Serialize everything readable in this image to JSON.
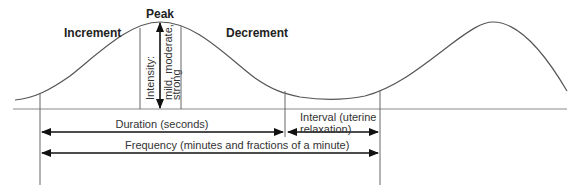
{
  "diagram": {
    "labels": {
      "increment": "Increment",
      "peak": "Peak",
      "decrement": "Decrement",
      "intensity": "Intensity:",
      "intensity_values_line1": "mild, moderate,",
      "intensity_values_line2": "strong",
      "duration": "Duration (seconds)",
      "interval_line1": "Interval (uterine",
      "interval_line2": "relaxation)",
      "frequency": "Frequency (minutes and fractions of a minute)"
    },
    "colors": {
      "line": "#555555",
      "arrow": "#111111",
      "text": "#222222",
      "baseline": "#888888"
    }
  }
}
